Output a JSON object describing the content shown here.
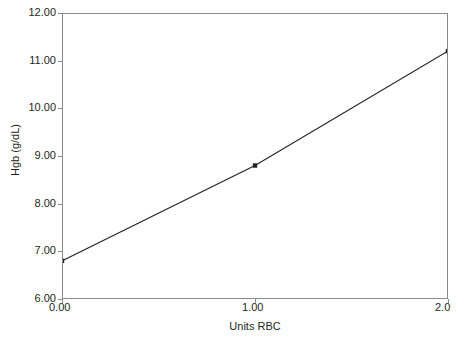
{
  "chart_data": {
    "type": "line",
    "title": "",
    "subtitle": "",
    "xlabel": "Units RBC",
    "ylabel": "Hgb (g/dL)",
    "x": [
      0.0,
      1.0,
      2.0
    ],
    "values": [
      6.8,
      8.8,
      11.2
    ],
    "series": [
      {
        "name": "Hgb response",
        "x": [
          0.0,
          1.0,
          2.0
        ],
        "values": [
          6.8,
          8.8,
          11.2
        ]
      }
    ],
    "xlim": [
      0.0,
      2.0
    ],
    "ylim": [
      6.0,
      12.0
    ],
    "x_tick_values": [
      0.0,
      1.0,
      2.0
    ],
    "x_tick_labels": [
      "0.00",
      "1.00",
      "2.0"
    ],
    "y_tick_values": [
      6.0,
      7.0,
      8.0,
      9.0,
      10.0,
      11.0,
      12.0
    ],
    "y_tick_labels": [
      "6.00",
      "7.00",
      "8.00",
      "9.00",
      "10.00",
      "11.00",
      "12.00"
    ],
    "grid": false,
    "legend": "none",
    "marker": "square",
    "line_color": "#231f20",
    "frame_color": "#8a8a8a",
    "annotations": []
  }
}
